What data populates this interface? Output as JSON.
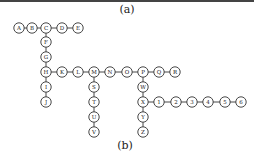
{
  "captions": {
    "top": "(a)",
    "bottom": "(b)"
  },
  "style": {
    "stroke": "#333333",
    "fill": "#ffffff",
    "rule": "#444444"
  },
  "radius": 5.2,
  "nodes": [
    {
      "id": "A",
      "label": "A",
      "x": 19,
      "y": 28
    },
    {
      "id": "B",
      "label": "B",
      "x": 32,
      "y": 28
    },
    {
      "id": "C",
      "label": "C",
      "x": 46,
      "y": 28
    },
    {
      "id": "D",
      "label": "D",
      "x": 62,
      "y": 28
    },
    {
      "id": "E",
      "label": "E",
      "x": 78,
      "y": 28
    },
    {
      "id": "F",
      "label": "F",
      "x": 46,
      "y": 42
    },
    {
      "id": "G",
      "label": "G",
      "x": 46,
      "y": 57
    },
    {
      "id": "H",
      "label": "H",
      "x": 46,
      "y": 72
    },
    {
      "id": "K",
      "label": "K",
      "x": 62,
      "y": 72
    },
    {
      "id": "L",
      "label": "L",
      "x": 78,
      "y": 72
    },
    {
      "id": "M",
      "label": "M",
      "x": 94,
      "y": 72
    },
    {
      "id": "N",
      "label": "N",
      "x": 110,
      "y": 72
    },
    {
      "id": "O",
      "label": "O",
      "x": 127,
      "y": 72
    },
    {
      "id": "P",
      "label": "P",
      "x": 143,
      "y": 72
    },
    {
      "id": "Q",
      "label": "Q",
      "x": 159,
      "y": 72
    },
    {
      "id": "R",
      "label": "R",
      "x": 175,
      "y": 72
    },
    {
      "id": "I",
      "label": "I",
      "x": 46,
      "y": 87
    },
    {
      "id": "J",
      "label": "J",
      "x": 46,
      "y": 102
    },
    {
      "id": "S",
      "label": "S",
      "x": 94,
      "y": 87
    },
    {
      "id": "T",
      "label": "T",
      "x": 94,
      "y": 102
    },
    {
      "id": "U",
      "label": "U",
      "x": 94,
      "y": 117
    },
    {
      "id": "V",
      "label": "V",
      "x": 94,
      "y": 132
    },
    {
      "id": "W",
      "label": "W",
      "x": 143,
      "y": 87
    },
    {
      "id": "X",
      "label": "X",
      "x": 143,
      "y": 102
    },
    {
      "id": "Y",
      "label": "Y",
      "x": 143,
      "y": 117
    },
    {
      "id": "Z",
      "label": "Z",
      "x": 143,
      "y": 132
    },
    {
      "id": "1",
      "label": "1",
      "x": 159,
      "y": 102
    },
    {
      "id": "2",
      "label": "2",
      "x": 176,
      "y": 102
    },
    {
      "id": "3",
      "label": "3",
      "x": 192,
      "y": 102
    },
    {
      "id": "4",
      "label": "4",
      "x": 208,
      "y": 102
    },
    {
      "id": "5",
      "label": "5",
      "x": 225,
      "y": 102
    },
    {
      "id": "6",
      "label": "6",
      "x": 241,
      "y": 102
    }
  ],
  "edges": [
    [
      "A",
      "B"
    ],
    [
      "B",
      "C"
    ],
    [
      "C",
      "D"
    ],
    [
      "D",
      "E"
    ],
    [
      "C",
      "F"
    ],
    [
      "F",
      "G"
    ],
    [
      "G",
      "H"
    ],
    [
      "H",
      "K"
    ],
    [
      "K",
      "L"
    ],
    [
      "L",
      "M"
    ],
    [
      "M",
      "N"
    ],
    [
      "N",
      "O"
    ],
    [
      "O",
      "P"
    ],
    [
      "P",
      "Q"
    ],
    [
      "Q",
      "R"
    ],
    [
      "H",
      "I"
    ],
    [
      "I",
      "J"
    ],
    [
      "M",
      "S"
    ],
    [
      "S",
      "T"
    ],
    [
      "T",
      "U"
    ],
    [
      "U",
      "V"
    ],
    [
      "P",
      "W"
    ],
    [
      "W",
      "X"
    ],
    [
      "X",
      "Y"
    ],
    [
      "Y",
      "Z"
    ],
    [
      "X",
      "1"
    ],
    [
      "1",
      "2"
    ],
    [
      "2",
      "3"
    ],
    [
      "3",
      "4"
    ],
    [
      "4",
      "5"
    ],
    [
      "5",
      "6"
    ]
  ]
}
